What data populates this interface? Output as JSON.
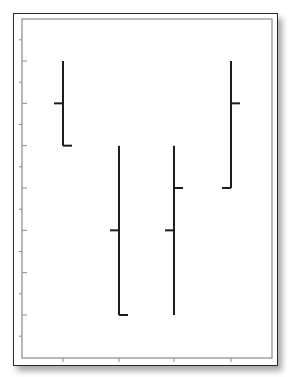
{
  "chart_data": {
    "type": "ohlc",
    "title": "",
    "xlabel": "",
    "ylabel": "",
    "categories": [
      "1",
      "2",
      "3",
      "4"
    ],
    "series": [
      {
        "name": "open",
        "values": [
          6,
          3,
          3,
          4
        ]
      },
      {
        "name": "high",
        "values": [
          7,
          5,
          5,
          7
        ]
      },
      {
        "name": "low",
        "values": [
          5,
          1,
          1,
          4
        ]
      },
      {
        "name": "close",
        "values": [
          5,
          1,
          4,
          6
        ]
      }
    ],
    "ylim": [
      -0.5,
      8.0
    ],
    "y_major_ticks": [
      1,
      2,
      3,
      4,
      5,
      6,
      7
    ],
    "y_minor_ticks": [
      0.5,
      1.5,
      2.5,
      3.5,
      4.5,
      5.5,
      6.5,
      7.5
    ],
    "x_ticks": [
      1,
      2,
      3,
      4
    ],
    "grid": false,
    "legend": null,
    "tick_labels_visible": false
  },
  "style": {
    "bar_color": "#1e1e1e",
    "axis_color": "#8a8a8a",
    "frame_color": "#2a2a2a"
  }
}
